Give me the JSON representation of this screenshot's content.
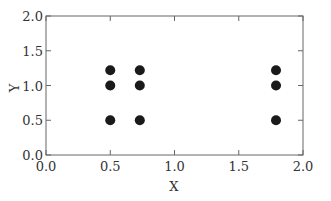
{
  "chart_data": {
    "type": "scatter",
    "title": "",
    "xlabel": "X",
    "ylabel": "Y",
    "xlim": [
      0.0,
      2.0
    ],
    "ylim": [
      0.0,
      2.0
    ],
    "xticks": [
      "0.0",
      "0.5",
      "1.0",
      "1.5",
      "2.0"
    ],
    "yticks": [
      "0.0",
      "0.5",
      "1.0",
      "1.5",
      "2.0"
    ],
    "grid": false,
    "legend": null,
    "marker_color": "#1a1a1a",
    "series": [
      {
        "name": "points",
        "x": [
          0.5,
          0.5,
          0.5,
          0.73,
          0.73,
          0.73,
          1.79,
          1.79,
          1.79
        ],
        "y": [
          1.22,
          1.0,
          0.5,
          1.22,
          1.0,
          0.5,
          1.22,
          1.0,
          0.5
        ]
      }
    ]
  }
}
